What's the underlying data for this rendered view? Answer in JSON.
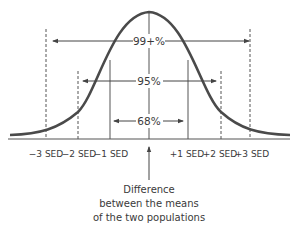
{
  "diagram": {
    "type": "normal-distribution",
    "intervals": [
      {
        "label": "99+%",
        "range": "±3 SED"
      },
      {
        "label": "95%",
        "range": "±2 SED"
      },
      {
        "label": "68%",
        "range": "±1 SED"
      }
    ],
    "axis_labels": [
      "−3 SED",
      "−2 SED",
      "−1 SED",
      "+1 SED",
      "+2 SED",
      "+3 SED"
    ],
    "caption_lines": [
      "Difference",
      "between the means",
      "of the two populations"
    ],
    "colors": {
      "curve": "#4a4a4a",
      "lines": "#555555",
      "text": "#3a3a3a"
    }
  }
}
